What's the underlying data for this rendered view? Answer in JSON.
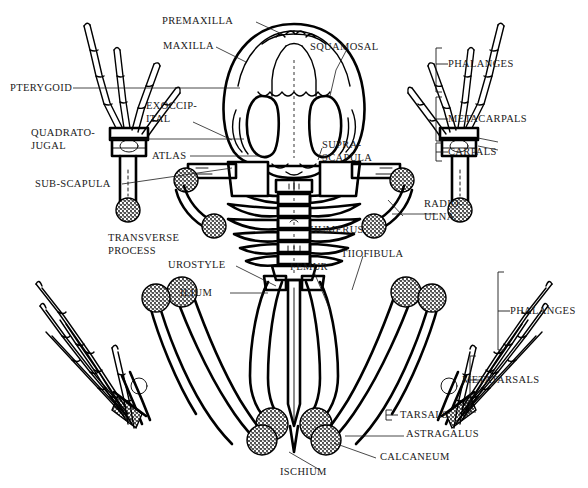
{
  "figure": {
    "background_color": "#ffffff",
    "ink_color": "#000000",
    "label_color": "#1a1a1a"
  },
  "labels": {
    "premaxilla": "PREMAXILLA",
    "maxilla": "MAXILLA",
    "squamosal": "SQUAMOSAL",
    "pterygoid": "PTERYGOID",
    "exoccipital_line1": "EXOCCIP-",
    "exoccipital_line2": "ITAL",
    "quadratojugal_line1": "QUADRATO-",
    "quadratojugal_line2": "JUGAL",
    "atlas": "ATLAS",
    "supra_scapula_line1": "SUPRA-",
    "supra_scapula_line2": "SCAPULA",
    "sub_scapula": "SUB-SCAPULA",
    "transverse_process_line1": "TRANSVERSE",
    "transverse_process_line2": "PROCESS",
    "humerus": "HUMERUS",
    "radio_ulna_line1": "RADIO-",
    "radio_ulna_line2": "ULNA",
    "urostyle": "UROSTYLE",
    "ilium": "ILIUM",
    "femur": "FEMUR",
    "tibiofibula": "TIIOFIBULA",
    "ischium": "ISCHIUM",
    "astragalus": "ASTRAGALUS",
    "calcaneum": "CALCANEUM"
  },
  "brackets": {
    "phalanges_fore": "PHALANGES",
    "metacarpals": "METACARPALS",
    "carpals": "CARPALS",
    "phalanges_hind": "PHALANGES",
    "metatarsals": "METATARSALS",
    "tarsals": "TARSALS"
  }
}
